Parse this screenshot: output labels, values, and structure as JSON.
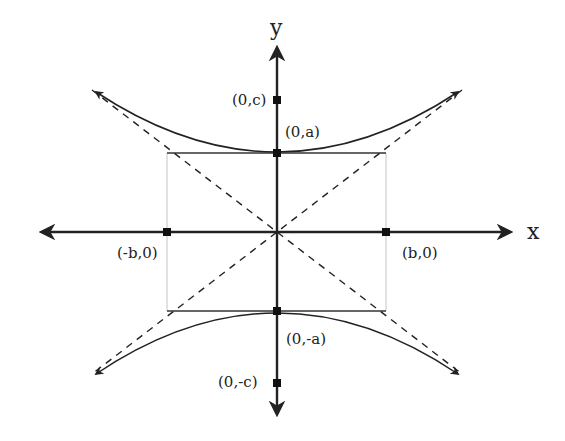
{
  "diagram": {
    "axes": {
      "x_label": "x",
      "y_label": "y"
    },
    "points": {
      "focus_top": {
        "label": "(0,c)"
      },
      "vertex_top": {
        "label": "(0,a)"
      },
      "vertex_bottom": {
        "label": "(0,-a)"
      },
      "focus_bottom": {
        "label": "(0,-c)"
      },
      "co_vertex_left": {
        "label": "(-b,0)"
      },
      "co_vertex_right": {
        "label": "(b,0)"
      }
    },
    "elements": [
      "x-axis with arrows",
      "y-axis with arrows",
      "upper hyperbola branch",
      "lower hyperbola branch",
      "dashed asymptotes",
      "fundamental rectangle"
    ],
    "colors": {
      "ink": "#222222",
      "rect_sides": "#bbbbbb",
      "background": "#ffffff"
    }
  }
}
